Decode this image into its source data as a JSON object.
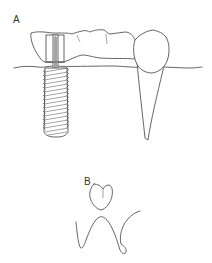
{
  "figure": {
    "panels": [
      {
        "id": "A",
        "label": "A",
        "description": "Implant-supported crown bridged to natural tooth crown, with gum line, threaded implant fixture and natural tooth root"
      },
      {
        "id": "B",
        "label": "B",
        "description": "Occlusal outline of a tooth above a wavy gingival/bone contour"
      }
    ]
  },
  "colors": {
    "line": "#555555",
    "background": "#ffffff",
    "label": "#333333"
  }
}
